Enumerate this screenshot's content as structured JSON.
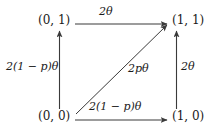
{
  "diagram": {
    "type": "state-transition-square",
    "nodes": [
      {
        "id": "node-01",
        "label": "(0, 1)",
        "position": "top-left",
        "state": "(0,1)"
      },
      {
        "id": "node-11",
        "label": "(1, 1)",
        "position": "top-right",
        "state": "(1,1)"
      },
      {
        "id": "node-00",
        "label": "(0, 0)",
        "position": "bottom-left",
        "state": "(0,0)"
      },
      {
        "id": "node-10",
        "label": "(1, 0)",
        "position": "bottom-right",
        "state": "(1,0)"
      }
    ],
    "edges": [
      {
        "id": "edge-top",
        "from": "(0, 1)",
        "to": "(1, 1)",
        "label": "2θ",
        "direction": "right"
      },
      {
        "id": "edge-left",
        "from": "(0, 0)",
        "to": "(0, 1)",
        "label": "2(1 − p)θ",
        "direction": "up"
      },
      {
        "id": "edge-right",
        "from": "(1, 0)",
        "to": "(1, 1)",
        "label": "2θ",
        "direction": "up"
      },
      {
        "id": "edge-diag",
        "from": "(0, 0)",
        "to": "(1, 1)",
        "label": "2pθ",
        "direction": "up-right"
      },
      {
        "id": "edge-bottom",
        "from": "(0, 0)",
        "to": "(1, 0)",
        "label": "2(1 − p)θ",
        "direction": "right"
      }
    ],
    "colors": {
      "stroke": "#3a3a3a",
      "text": "#1a1a1a",
      "background": "#ffffff"
    }
  }
}
